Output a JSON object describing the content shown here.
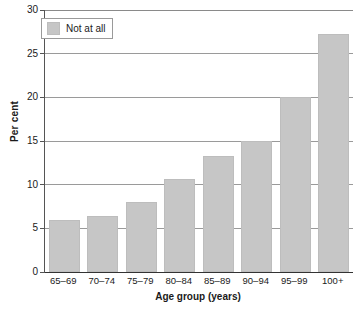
{
  "chart_data": {
    "type": "bar",
    "title": "",
    "categories": [
      "65–69",
      "70–74",
      "75–79",
      "80–84",
      "85–89",
      "90–94",
      "95–99",
      "100+"
    ],
    "values": [
      5.9,
      6.4,
      8.0,
      10.7,
      13.3,
      15.0,
      20.0,
      27.3
    ],
    "series": [
      {
        "name": "Not at all",
        "values": [
          5.9,
          6.4,
          8.0,
          10.7,
          13.3,
          15.0,
          20.0,
          27.3
        ],
        "color": "#c6c6c6"
      }
    ],
    "xlabel": "Age group (years)",
    "ylabel": "Per cent",
    "ylim": [
      0,
      30
    ],
    "yticks": [
      0,
      5,
      10,
      15,
      20,
      25,
      30
    ],
    "ytick_labels": [
      "0",
      "5",
      "10",
      "15",
      "20",
      "25",
      "30"
    ],
    "grid": true,
    "grid_axis": "y",
    "legend": {
      "position": "top-left",
      "entries": [
        {
          "label": "Not at all",
          "color": "#c6c6c6"
        }
      ]
    },
    "colors": {
      "bar": "#c6c6c6",
      "bar_edge": "#bdbdbd",
      "gridline": "#9a9a9a",
      "axis": "#333333",
      "text": "#1a1a1a",
      "background": "#ffffff"
    }
  }
}
